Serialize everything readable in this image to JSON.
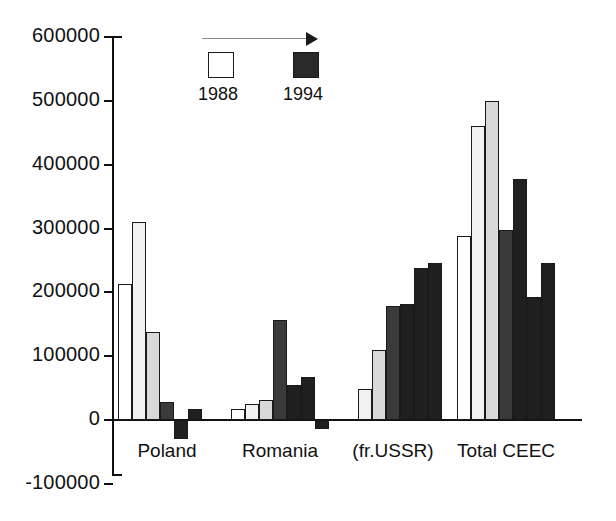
{
  "chart_data": {
    "type": "bar",
    "title": "",
    "subtitle": "",
    "xlabel": "",
    "ylabel": "",
    "ylim": [
      -100000,
      600000
    ],
    "ytick_labels": [
      "600000",
      "500000",
      "400000",
      "300000",
      "200000",
      "100000",
      "0",
      "-100000"
    ],
    "ytick_values": [
      600000,
      500000,
      400000,
      300000,
      200000,
      100000,
      0,
      -100000
    ],
    "grid": false,
    "legend_position": "top-center",
    "legend": [
      {
        "label": "1988",
        "swatch": "white"
      },
      {
        "label": "1994",
        "swatch": "black"
      }
    ],
    "legend_note": "arrow indicating progression from 1988 to 1994",
    "categories": [
      "Poland",
      "Romania",
      "(fr.USSR)",
      "Total CEEC"
    ],
    "series": [
      {
        "name": "1988",
        "values": [
          213000,
          18000,
          0,
          288000
        ]
      },
      {
        "name": "1989",
        "values": [
          310000,
          25000,
          48000,
          460000
        ]
      },
      {
        "name": "1990",
        "values": [
          138000,
          32000,
          110000,
          500000
        ]
      },
      {
        "name": "1991",
        "values": [
          28000,
          156000,
          178000,
          298000
        ]
      },
      {
        "name": "1992",
        "values": [
          -30000,
          55000,
          182000,
          378000
        ]
      },
      {
        "name": "1993",
        "values": [
          18000,
          68000,
          238000,
          192000
        ]
      },
      {
        "name": "1994",
        "values": [
          0,
          -14000,
          246000,
          246000
        ]
      }
    ]
  },
  "axis": {
    "y_ticks": [
      {
        "label": "600000",
        "value": 600000
      },
      {
        "label": "500000",
        "value": 500000
      },
      {
        "label": "400000",
        "value": 400000
      },
      {
        "label": "300000",
        "value": 300000
      },
      {
        "label": "200000",
        "value": 200000
      },
      {
        "label": "100000",
        "value": 100000
      },
      {
        "label": "0",
        "value": 0
      },
      {
        "label": "-100000",
        "value": -100000
      }
    ]
  },
  "legend": {
    "start_label": "1988",
    "end_label": "1994"
  },
  "groups": [
    {
      "label": "Poland"
    },
    {
      "label": "Romania"
    },
    {
      "label": "(fr.USSR)"
    },
    {
      "label": "Total CEEC"
    }
  ],
  "colors": {
    "bar_fills": [
      "#ffffff",
      "#f2f2f2",
      "#d9d9d9",
      "#3a3a3a",
      "#1f1f1f",
      "#1f1f1f",
      "#1f1f1f"
    ],
    "outline": "#1a1a1a",
    "axis": "#111111",
    "arrow": "#8a8a8a"
  }
}
